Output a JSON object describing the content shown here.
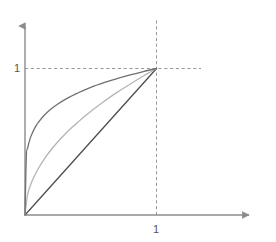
{
  "chart_data": {
    "type": "line",
    "title": "",
    "subtitle": "",
    "xlabel": "",
    "ylabel": "",
    "xlim": [
      0,
      1.75
    ],
    "ylim": [
      0,
      1.35
    ],
    "grid": false,
    "legend": null,
    "axis_arrows": true,
    "x_ticks": [
      "1"
    ],
    "y_ticks": [
      "1"
    ],
    "x_tick_values": [
      1
    ],
    "y_tick_values": [
      1
    ],
    "reference_lines": [
      {
        "name": "x-equals-one",
        "orientation": "vertical",
        "value": 1,
        "style": "dashed",
        "color": "#999999"
      },
      {
        "name": "y-equals-one",
        "orientation": "horizontal",
        "value": 1,
        "style": "dashed",
        "color": "#999999"
      }
    ],
    "series": [
      {
        "name": "steep-concave-curve",
        "color": "#707070",
        "width": 1.3,
        "x": [
          0,
          0.01,
          0.02,
          0.04,
          0.06,
          0.08,
          0.1,
          0.15,
          0.2,
          0.25,
          0.3,
          0.35,
          0.4,
          0.5,
          0.6,
          0.7,
          0.8,
          0.9,
          1.0
        ],
        "values": [
          0,
          0.398,
          0.457,
          0.525,
          0.568,
          0.603,
          0.631,
          0.684,
          0.725,
          0.758,
          0.786,
          0.81,
          0.832,
          0.871,
          0.903,
          0.931,
          0.956,
          0.979,
          1.0
        ]
      },
      {
        "name": "moderate-concave-curve",
        "color": "#b4b4b4",
        "width": 1.3,
        "x": [
          0,
          0.02,
          0.05,
          0.1,
          0.15,
          0.2,
          0.25,
          0.3,
          0.35,
          0.4,
          0.45,
          0.5,
          0.6,
          0.7,
          0.8,
          0.9,
          1.0
        ],
        "values": [
          0,
          0.141,
          0.224,
          0.316,
          0.387,
          0.447,
          0.5,
          0.548,
          0.592,
          0.632,
          0.671,
          0.707,
          0.775,
          0.837,
          0.894,
          0.949,
          1.0
        ]
      },
      {
        "name": "identity-line",
        "color": "#4d4d4d",
        "width": 1.3,
        "x": [
          0,
          1.0
        ],
        "values": [
          0,
          1.0
        ]
      }
    ],
    "colors": {
      "axis": "#8c8c8c",
      "dashed": "#999999",
      "tick_label": "#555555",
      "background": "#ffffff"
    }
  }
}
